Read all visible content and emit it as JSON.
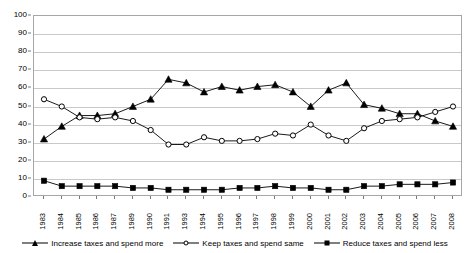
{
  "chart_data": {
    "type": "line",
    "title": "",
    "subtitle": "",
    "xlabel": "",
    "ylabel": "",
    "ylim": [
      0,
      100
    ],
    "ytick_step": 10,
    "yticks": [
      0,
      10,
      20,
      30,
      40,
      50,
      60,
      70,
      80,
      90,
      100
    ],
    "grid": true,
    "legend_position": "bottom",
    "categories": [
      "1983",
      "1984",
      "1985",
      "1986",
      "1987",
      "1989",
      "1990",
      "1991",
      "1993",
      "1994",
      "1995",
      "1996",
      "1997",
      "1998",
      "1999",
      "2000",
      "2001",
      "2002",
      "2003",
      "2004",
      "2005",
      "2006",
      "2007",
      "2008"
    ],
    "series": [
      {
        "name": "Increase taxes and spend more",
        "marker": "triangle",
        "values": [
          32,
          39,
          45,
          45,
          46,
          50,
          54,
          65,
          63,
          58,
          61,
          59,
          61,
          62,
          58,
          50,
          59,
          63,
          51,
          49,
          46,
          46,
          42,
          39
        ]
      },
      {
        "name": "Keep taxes and spend same",
        "marker": "circle-open",
        "values": [
          54,
          50,
          44,
          43,
          44,
          42,
          37,
          29,
          29,
          33,
          31,
          31,
          32,
          35,
          34,
          40,
          34,
          31,
          38,
          42,
          43,
          44,
          47,
          50
        ]
      },
      {
        "name": "Reduce taxes and spend less",
        "marker": "square",
        "values": [
          9,
          6,
          6,
          6,
          6,
          5,
          5,
          4,
          4,
          4,
          4,
          5,
          5,
          6,
          5,
          5,
          4,
          4,
          6,
          6,
          7,
          7,
          7,
          8
        ]
      }
    ]
  },
  "legend": {
    "entries": [
      {
        "label": "Increase taxes and spend more",
        "marker": "triangle"
      },
      {
        "label": "Keep taxes and spend same",
        "marker": "circle-open"
      },
      {
        "label": "Reduce taxes and spend less",
        "marker": "square"
      }
    ]
  },
  "colors": {
    "line": "#000000",
    "grid": "#c9c9c9",
    "border": "#a6a6a6",
    "background": "#ffffff",
    "text": "#000000"
  }
}
